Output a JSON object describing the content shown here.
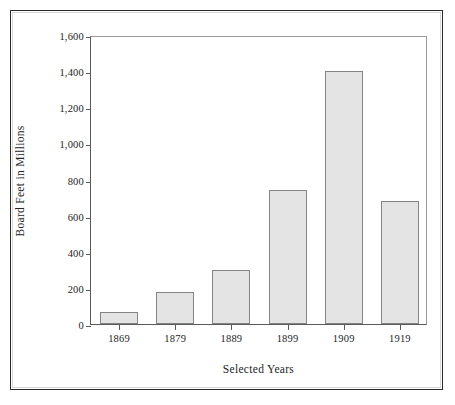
{
  "chart_data": {
    "type": "bar",
    "title": "",
    "subtitle": "",
    "categories": [
      "1869",
      "1879",
      "1889",
      "1899",
      "1909",
      "1919"
    ],
    "values": [
      65,
      175,
      300,
      740,
      1400,
      680
    ],
    "xlabel": "Selected Years",
    "ylabel": "Board Feet in Millions",
    "ylim": [
      0,
      1600
    ],
    "ytick_labels": [
      "0",
      "200",
      "400",
      "600",
      "800",
      "1,000",
      "1,200",
      "1,400",
      "1,600"
    ],
    "ytick_values": [
      0,
      200,
      400,
      600,
      800,
      1000,
      1200,
      1400,
      1600
    ],
    "grid": false,
    "legend": null,
    "legend_position": "none",
    "annotations": [],
    "bar_fill_color": "#e4e4e4",
    "bar_border_color": "#848484",
    "axis_color": "#5a5a5a",
    "text_color": "#242424",
    "frame_color": "#2b2b2b",
    "background_color": "#ffffff"
  }
}
